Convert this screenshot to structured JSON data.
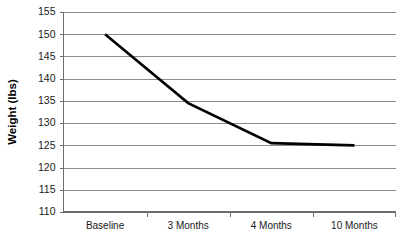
{
  "chart_data": {
    "type": "line",
    "title": "",
    "xlabel": "",
    "ylabel": "Weight (lbs)",
    "categories": [
      "Baseline",
      "3 Months",
      "4 Months",
      "10 Months"
    ],
    "series": [
      {
        "name": "Weight",
        "values": [
          150,
          134.5,
          125.5,
          125
        ]
      }
    ],
    "ylim": [
      110,
      155
    ],
    "yticks": [
      110,
      115,
      120,
      125,
      130,
      135,
      140,
      145,
      150,
      155
    ],
    "ytick_labels": [
      "110",
      "115",
      "120",
      "125",
      "130",
      "135",
      "140",
      "145",
      "150",
      "155"
    ],
    "grid": "horizontal",
    "legend": "none",
    "line_color": "#000000",
    "gridline_color": "#8c8c8c",
    "axis_color": "#6e6e6e",
    "background_color": "#ffffff"
  }
}
